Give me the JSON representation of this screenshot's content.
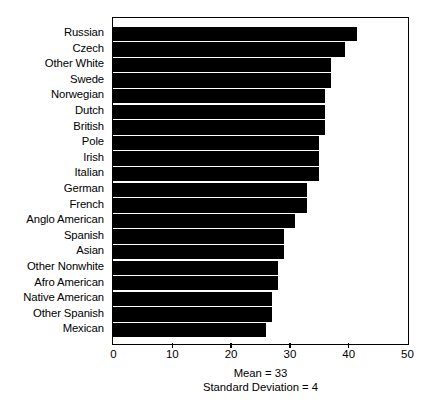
{
  "chart_data": {
    "type": "bar",
    "orientation": "horizontal",
    "title": "",
    "subtitle": "",
    "xlabel": "",
    "ylabel": "",
    "xlim": [
      0,
      50
    ],
    "xticks": [
      0,
      10,
      20,
      30,
      40,
      50
    ],
    "xtick_labels": [
      "0",
      "10",
      "20",
      "30",
      "40",
      "50"
    ],
    "grid": false,
    "legend": null,
    "bar_color": "#000000",
    "background_color": "#ffffff",
    "categories": [
      "Russian",
      "Czech",
      "Other White",
      "Swede",
      "Norwegian",
      "Dutch",
      "British",
      "Pole",
      "Irish",
      "Italian",
      "German",
      "French",
      "Anglo American",
      "Spanish",
      "Asian",
      "Other Nonwhite",
      "Afro American",
      "Native American",
      "Other Spanish",
      "Mexican"
    ],
    "values": [
      41.5,
      39.5,
      37,
      37,
      36,
      36,
      36,
      35,
      35,
      35,
      33,
      33,
      31,
      29,
      29,
      28,
      28,
      27,
      27,
      26
    ],
    "annotations": {
      "mean_line": "Mean = 33",
      "sd_line": "Standard Deviation = 4",
      "mean_value": 33,
      "standard_deviation_value": 4
    }
  }
}
